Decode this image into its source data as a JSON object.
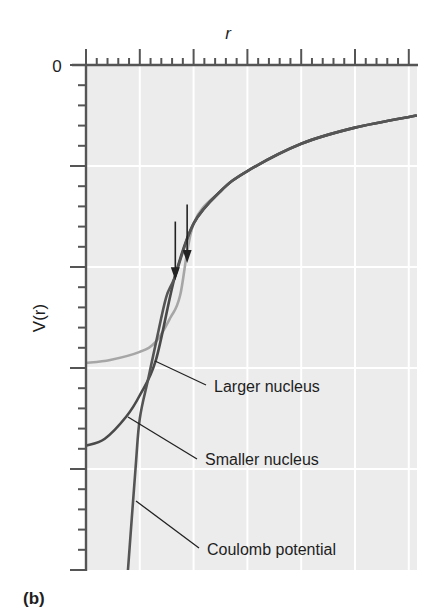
{
  "figure": {
    "panel_label": "(b)",
    "x_axis_label": "r",
    "y_axis_label": "V(r)",
    "y_zero_label": "0"
  },
  "annotations": {
    "larger_nucleus": "Larger nucleus",
    "smaller_nucleus": "Smaller nucleus",
    "coulomb_potential": "Coulomb potential",
    "arrows": 2
  },
  "colors": {
    "plot_background": "#ececec",
    "gridline": "#ffffff",
    "axis": "#555555",
    "coulomb_curve": "#555555",
    "smaller_nucleus_curve": "#4a4a4a",
    "larger_nucleus_curve": "#a6a6a6",
    "text": "#1e1e1e"
  },
  "chart_data": {
    "type": "line",
    "title": "",
    "xlabel": "r",
    "ylabel": "V(r)",
    "x_range": [
      0,
      6.15
    ],
    "y_range": [
      -5,
      0
    ],
    "grid": true,
    "x_major_tick_count": 6,
    "x_minor_per_major": 5,
    "y_major_tick_count": 5,
    "y_minor_per_major": 5,
    "tick_labels": {
      "y": [
        "0"
      ],
      "x": []
    },
    "series": [
      {
        "name": "Coulomb potential",
        "x": [
          0.78,
          0.92,
          1.0,
          1.16,
          1.32,
          1.49,
          1.65,
          2.0,
          2.5,
          3.0,
          4.0,
          5.0,
          6.15
        ],
        "y": [
          -5.0,
          -4.0,
          -3.5,
          -3.1,
          -2.7,
          -2.3,
          -2.1,
          -1.57,
          -1.25,
          -1.05,
          -0.78,
          -0.62,
          -0.5
        ]
      },
      {
        "name": "Smaller nucleus",
        "x": [
          0.0,
          0.35,
          0.75,
          1.0,
          1.3,
          1.65,
          2.0,
          2.5,
          3.0,
          4.0,
          5.0,
          6.15
        ],
        "y": [
          -3.77,
          -3.7,
          -3.48,
          -3.27,
          -2.92,
          -2.1,
          -1.57,
          -1.25,
          -1.05,
          -0.78,
          -0.62,
          -0.5
        ]
      },
      {
        "name": "Larger nucleus",
        "x": [
          0.0,
          0.45,
          1.0,
          1.3,
          1.57,
          1.75,
          2.0,
          2.5,
          3.0,
          4.0,
          5.0,
          6.15
        ],
        "y": [
          -2.95,
          -2.92,
          -2.84,
          -2.74,
          -2.5,
          -2.28,
          -1.57,
          -1.25,
          -1.05,
          -0.78,
          -0.62,
          -0.5
        ]
      }
    ],
    "annotations": [
      {
        "type": "arrow",
        "x": 1.66,
        "y_from": -1.55,
        "y_to": -2.13
      },
      {
        "type": "arrow",
        "x": 1.88,
        "y_from": -1.38,
        "y_to": -1.96
      },
      {
        "type": "label",
        "text": "Larger nucleus"
      },
      {
        "type": "label",
        "text": "Smaller nucleus"
      },
      {
        "type": "label",
        "text": "Coulomb potential"
      }
    ],
    "panel_label": "(b)"
  }
}
